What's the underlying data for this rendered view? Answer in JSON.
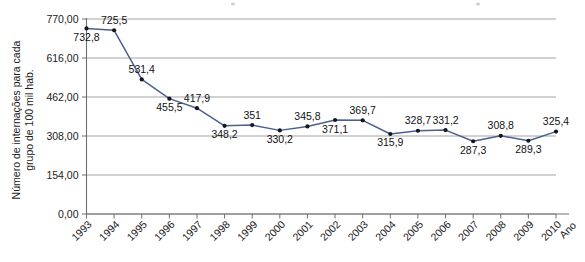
{
  "chart_data": {
    "type": "line",
    "title": "",
    "xlabel": "Ano",
    "ylabel": "Número de internações para cada grupo de 100 mil hab.",
    "categories": [
      "1993",
      "1994",
      "1995",
      "1996",
      "1997",
      "1998",
      "1999",
      "2000",
      "2001",
      "2002",
      "2003",
      "2004",
      "2005",
      "2006",
      "2007",
      "2008",
      "2009",
      "2010"
    ],
    "values": [
      732.8,
      725.5,
      531.4,
      455.5,
      417.9,
      348.2,
      351,
      330.2,
      345.8,
      371.1,
      369.7,
      315.9,
      328.7,
      331.2,
      287.3,
      308.8,
      289.3,
      325.4
    ],
    "point_labels": [
      "732,8",
      "725,5",
      "531,4",
      "455,5",
      "417,9",
      "348,2",
      "351",
      "330,2",
      "345,8",
      "371,1",
      "369,7",
      "315,9",
      "328,7",
      "331,2",
      "287,3",
      "308,8",
      "289,3",
      "325,4"
    ],
    "label_positions": [
      "below",
      "above",
      "above",
      "below",
      "above",
      "below",
      "above",
      "below",
      "above",
      "below",
      "above",
      "below",
      "above",
      "above",
      "below",
      "above",
      "below",
      "above"
    ],
    "ylim": [
      0,
      770
    ],
    "ytick_values": [
      0,
      154,
      308,
      462,
      616,
      770
    ],
    "ytick_labels": [
      "0,00",
      "154,00",
      "308,00",
      "462,00",
      "616,00",
      "770,00"
    ],
    "grid": true,
    "legend": "none",
    "series_color": "#4c5f91",
    "marker_color": "#16161c",
    "grid_color": "#8d8d8d",
    "axis_color": "#6e6e6e"
  }
}
